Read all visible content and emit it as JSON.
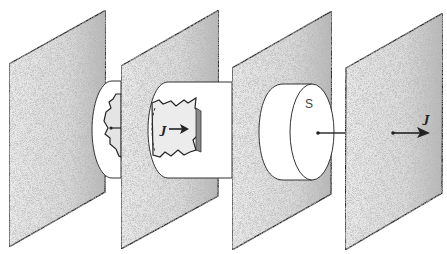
{
  "diagram": {
    "colors": {
      "background": "#ffffff",
      "panel_fill_light": "#e9e9e9",
      "panel_fill_dark": "#bdbdbd",
      "outline": "#2b2b2b",
      "torn_patch_shadow": "#8a8a8a"
    },
    "panels": [
      {
        "id": "panel-1",
        "points": "9,64 106,10 105,192 9,247"
      },
      {
        "id": "panel-2",
        "points": "121,66 219,10 218,196 121,249"
      },
      {
        "id": "panel-3",
        "points": "232,68 332,11 331,194 232,250"
      },
      {
        "id": "panel-4",
        "points": "346,68 443,13 442,193 345,250"
      }
    ],
    "labels": {
      "surface_label": "S",
      "vector_label_middle": "J",
      "vector_label_right": "J"
    },
    "elements": [
      {
        "name": "small-cylinder",
        "between": [
          "panel-1",
          "panel-2"
        ],
        "note": "half-disk bulge with torn patch and dot"
      },
      {
        "name": "long-cylinder",
        "between": [
          "panel-2",
          "panel-3"
        ],
        "note": "contains torn patch with vector arrow"
      },
      {
        "name": "disk-cylinder",
        "between": [
          "panel-3",
          "panel-4"
        ],
        "note": "front face labeled S, with line to next plane"
      },
      {
        "name": "vector-arrow-right",
        "on": "panel-4",
        "note": "arrow pointing right with vector label"
      }
    ]
  }
}
